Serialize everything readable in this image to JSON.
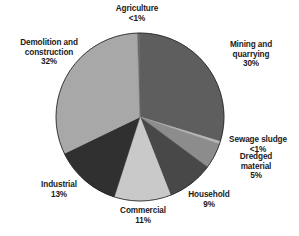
{
  "figure": {
    "background_color": "#ffffff",
    "outline_color": "#1a1a1a"
  },
  "chart_data": {
    "type": "pie",
    "title": "",
    "subtitle": "",
    "xlabel": "",
    "ylabel": "",
    "legend_position": "none",
    "grid": false,
    "start_angle_deg": 0,
    "direction": "clockwise",
    "center": {
      "x": 140,
      "y": 117
    },
    "radius": 84,
    "units": "percent",
    "categories": [
      "Mining and quarrying",
      "Sewage sludge",
      "Dredged material",
      "Household",
      "Commercial",
      "Industrial",
      "Demolition and construction",
      "Agriculture"
    ],
    "values": [
      30,
      0.5,
      5,
      9,
      11,
      13,
      32,
      0.5
    ],
    "value_labels": [
      "30%",
      "<1%",
      "5%",
      "9%",
      "11%",
      "13%",
      "32%",
      "<1%"
    ],
    "colors": [
      "#5e5e5e",
      "#b5b5b5",
      "#8c8c8c",
      "#484848",
      "#c9c9c9",
      "#303030",
      "#a8a8a8",
      "#6a6a6a"
    ],
    "slices": [
      {
        "label": "Mining and quarrying",
        "value": 30,
        "value_label": "30%",
        "color": "#5e5e5e"
      },
      {
        "label": "Sewage sludge",
        "value": 0.5,
        "value_label": "<1%",
        "color": "#b5b5b5"
      },
      {
        "label": "Dredged material",
        "value": 5,
        "value_label": "5%",
        "color": "#8c8c8c"
      },
      {
        "label": "Household",
        "value": 9,
        "value_label": "9%",
        "color": "#484848"
      },
      {
        "label": "Commercial",
        "value": 11,
        "value_label": "11%",
        "color": "#c9c9c9"
      },
      {
        "label": "Industrial",
        "value": 13,
        "value_label": "13%",
        "color": "#303030"
      },
      {
        "label": "Demolition and construction",
        "value": 32,
        "value_label": "32%",
        "color": "#a8a8a8"
      },
      {
        "label": "Agriculture",
        "value": 0.5,
        "value_label": "<1%",
        "color": "#6a6a6a"
      }
    ]
  },
  "labels": {
    "agriculture": {
      "line1": "Agriculture",
      "value": "<1%"
    },
    "mining": {
      "line1": "Mining and",
      "line2": "quarrying",
      "value": "30%"
    },
    "sewage": {
      "line1": "Sewage sludge",
      "value": "<1%"
    },
    "dredged": {
      "line1": "Dredged",
      "line2": "material",
      "value": "5%"
    },
    "household": {
      "line1": "Household",
      "value": "9%"
    },
    "commercial": {
      "line1": "Commercial",
      "value": "11%"
    },
    "industrial": {
      "line1": "Industrial",
      "value": "13%"
    },
    "demolition": {
      "line1": "Demolition and",
      "line2": "construction",
      "value": "32%"
    }
  }
}
